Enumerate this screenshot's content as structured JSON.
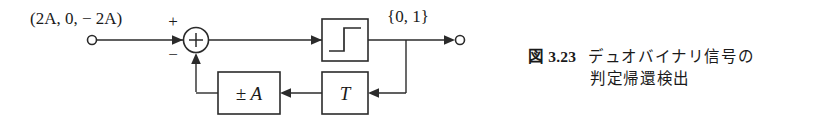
{
  "figure": {
    "caption_label": "図 3.23",
    "caption_lines": [
      "デュオバイナリ信号の",
      "判定帰還検出"
    ]
  },
  "diagram": {
    "type": "block-diagram",
    "input_label": "(2A, 0, − 2A)",
    "output_label": "{0, 1}",
    "summing_junction": {
      "symbol": "+",
      "plus_sign": "+",
      "minus_sign": "−"
    },
    "blocks": [
      {
        "id": "threshold",
        "label": "",
        "symbol": "step-function"
      },
      {
        "id": "delay",
        "label": "T"
      },
      {
        "id": "gain",
        "label": "± A"
      }
    ],
    "stroke_color": "#2b2b2b",
    "background": "#ffffff"
  }
}
